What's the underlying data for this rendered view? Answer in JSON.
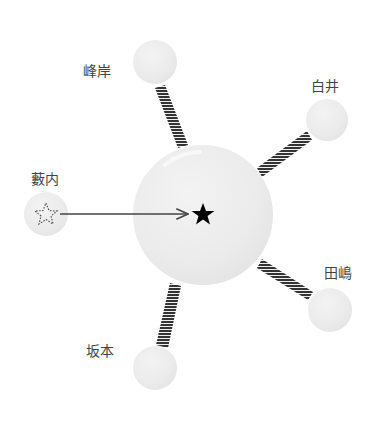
{
  "diagram": {
    "type": "relationship-star",
    "colors": {
      "node_fill": "#ebebeb",
      "link_hatch": "#333333",
      "arrow": "#444444",
      "star": "#000000"
    },
    "center": {
      "cx": 203,
      "cy": 215,
      "r": 70,
      "symbol": "★",
      "icon": "star-filled-icon"
    },
    "nodes": [
      {
        "id": "minegishi",
        "label": "峰岸",
        "cx": 155,
        "cy": 62,
        "r": 22,
        "lx": 97,
        "ly": 70,
        "link": "hatched"
      },
      {
        "id": "shirai",
        "label": "白井",
        "cx": 327,
        "cy": 120,
        "r": 21,
        "lx": 325,
        "ly": 85,
        "link": "hatched"
      },
      {
        "id": "yabuuchi",
        "label": "藪内",
        "cx": 46,
        "cy": 214,
        "r": 22,
        "lx": 45,
        "ly": 178,
        "link": "arrow",
        "icon": "star-dotted-icon"
      },
      {
        "id": "tajima",
        "label": "田嶋",
        "cx": 330,
        "cy": 310,
        "r": 22,
        "lx": 338,
        "ly": 272,
        "link": "hatched"
      },
      {
        "id": "sakamoto",
        "label": "坂本",
        "cx": 155,
        "cy": 368,
        "r": 22,
        "lx": 100,
        "ly": 350,
        "link": "hatched"
      }
    ]
  }
}
